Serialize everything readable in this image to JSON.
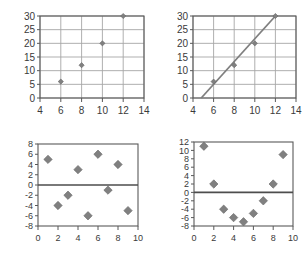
{
  "figure": {
    "background": "#ffffff",
    "marker_color": "#808080",
    "marker_edge_color": "#666666",
    "grid_color": "#a6a6a6",
    "axis_color": "#595959",
    "zero_line_color": "#4d4d4d",
    "trend_line_color": "#7f7f7f",
    "tick_label_color": "#3a3a3a",
    "panel_count": 4
  },
  "chart_data": [
    {
      "id": "top-left",
      "type": "scatter",
      "title": "",
      "xlabel": "",
      "ylabel": "",
      "xlim": [
        4,
        14
      ],
      "ylim": [
        0,
        30
      ],
      "xticks": [
        4,
        6,
        8,
        10,
        12,
        14
      ],
      "yticks": [
        0,
        5,
        10,
        15,
        20,
        25,
        30
      ],
      "xtick_labels": [
        "4",
        "6",
        "8",
        "10",
        "12",
        "14"
      ],
      "ytick_labels": [
        "0",
        "5",
        "10",
        "15",
        "20",
        "25",
        "30"
      ],
      "grid": true,
      "legend": false,
      "marker": "diamond",
      "points": [
        {
          "x": 6,
          "y": 6
        },
        {
          "x": 8,
          "y": 12
        },
        {
          "x": 10,
          "y": 20
        },
        {
          "x": 12,
          "y": 30
        }
      ]
    },
    {
      "id": "top-right",
      "type": "scatter",
      "title": "",
      "xlabel": "",
      "ylabel": "",
      "xlim": [
        4,
        14
      ],
      "ylim": [
        0,
        30
      ],
      "xticks": [
        4,
        6,
        8,
        10,
        12,
        14
      ],
      "yticks": [
        0,
        5,
        10,
        15,
        20,
        25,
        30
      ],
      "xtick_labels": [
        "4",
        "6",
        "8",
        "10",
        "12",
        "14"
      ],
      "ytick_labels": [
        "0",
        "5",
        "10",
        "15",
        "20",
        "25",
        "30"
      ],
      "grid": true,
      "legend": false,
      "marker": "diamond",
      "points": [
        {
          "x": 6,
          "y": 6
        },
        {
          "x": 8,
          "y": 12
        },
        {
          "x": 10,
          "y": 20
        },
        {
          "x": 12,
          "y": 30
        }
      ],
      "trend_line": {
        "x0": 4.8,
        "y0": 0,
        "x1": 12,
        "y1": 30
      }
    },
    {
      "id": "bottom-left",
      "type": "scatter",
      "title": "",
      "xlabel": "",
      "ylabel": "",
      "xlim": [
        0,
        10
      ],
      "ylim": [
        -8,
        8
      ],
      "xticks": [
        0,
        2,
        4,
        6,
        8,
        10
      ],
      "yticks": [
        -8,
        -6,
        -4,
        -2,
        0,
        2,
        4,
        6,
        8
      ],
      "xtick_labels": [
        "0",
        "2",
        "4",
        "6",
        "8",
        "10"
      ],
      "ytick_labels": [
        "-8",
        "-6",
        "-4",
        "-2",
        "0",
        "2",
        "4",
        "6",
        "8"
      ],
      "grid": false,
      "legend": false,
      "marker": "diamond",
      "zero_line": 0,
      "points": [
        {
          "x": 1,
          "y": 5
        },
        {
          "x": 2,
          "y": -4
        },
        {
          "x": 3,
          "y": -2
        },
        {
          "x": 4,
          "y": 3
        },
        {
          "x": 5,
          "y": -6
        },
        {
          "x": 6,
          "y": 6
        },
        {
          "x": 7,
          "y": -1
        },
        {
          "x": 8,
          "y": 4
        },
        {
          "x": 9,
          "y": -5
        }
      ]
    },
    {
      "id": "bottom-right",
      "type": "scatter",
      "title": "",
      "xlabel": "",
      "ylabel": "",
      "xlim": [
        0,
        10
      ],
      "ylim": [
        -8,
        12
      ],
      "xticks": [
        0,
        2,
        4,
        6,
        8,
        10
      ],
      "yticks": [
        -8,
        -6,
        -4,
        -2,
        0,
        2,
        4,
        6,
        8,
        10,
        12
      ],
      "xtick_labels": [
        "0",
        "2",
        "4",
        "6",
        "8",
        "10"
      ],
      "ytick_labels": [
        "-8",
        "-6",
        "-4",
        "-2",
        "0",
        "2",
        "4",
        "6",
        "8",
        "10",
        "12"
      ],
      "grid": false,
      "legend": false,
      "marker": "diamond",
      "zero_line": 0,
      "points": [
        {
          "x": 1,
          "y": 11
        },
        {
          "x": 2,
          "y": 2
        },
        {
          "x": 3,
          "y": -4
        },
        {
          "x": 4,
          "y": -6
        },
        {
          "x": 5,
          "y": -7
        },
        {
          "x": 6,
          "y": -5
        },
        {
          "x": 7,
          "y": -2
        },
        {
          "x": 8,
          "y": 2
        },
        {
          "x": 9,
          "y": 9
        }
      ]
    }
  ]
}
